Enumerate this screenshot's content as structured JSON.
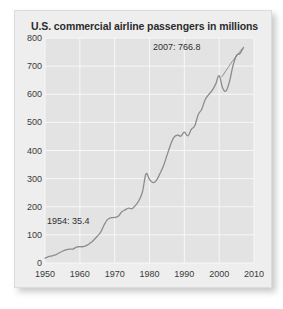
{
  "figure": {
    "title": "U.S. commercial airline passengers in millions",
    "card_bg": "#eeeeee",
    "plot_bg": "#e3e3e3",
    "line_color": "#8c8c8c",
    "grid_color": "#f7f7f7",
    "text_color": "#2b2b2b"
  },
  "chart_data": {
    "type": "line",
    "title": "U.S. commercial airline passengers in millions",
    "xlabel": "",
    "ylabel": "",
    "xlim": [
      1950,
      2010
    ],
    "ylim": [
      0,
      800
    ],
    "grid": true,
    "legend": null,
    "ytick_labels": [
      "800",
      "700",
      "600",
      "500",
      "400",
      "300",
      "200",
      "100",
      "0"
    ],
    "yticks": [
      800,
      700,
      600,
      500,
      400,
      300,
      200,
      100,
      0
    ],
    "xtick_labels": [
      "1950",
      "1960",
      "1970",
      "1980",
      "1990",
      "2000",
      "2010"
    ],
    "xticks": [
      1950,
      1960,
      1970,
      1980,
      1990,
      2000,
      2010
    ],
    "annotations": [
      {
        "name": "start-point-label",
        "text": "1954: 35.4",
        "x": 1954,
        "y": 35.4
      },
      {
        "name": "peak-point-label",
        "text": "2007: 766.8",
        "x": 2007,
        "y": 766.8
      }
    ],
    "x": [
      1950,
      1951,
      1952,
      1953,
      1954,
      1955,
      1956,
      1957,
      1958,
      1959,
      1960,
      1961,
      1962,
      1963,
      1964,
      1965,
      1966,
      1967,
      1968,
      1969,
      1970,
      1971,
      1972,
      1973,
      1974,
      1975,
      1976,
      1977,
      1978,
      1979,
      1980,
      1981,
      1982,
      1983,
      1984,
      1985,
      1986,
      1987,
      1988,
      1989,
      1990,
      1991,
      1992,
      1993,
      1994,
      1995,
      1996,
      1997,
      1998,
      1999,
      2000,
      2001,
      2002,
      2003,
      2004,
      2005,
      2006,
      2007
    ],
    "y": [
      17.3,
      22.7,
      25.5,
      28.7,
      35.4,
      41.7,
      46.7,
      49.5,
      49.4,
      56.4,
      57.9,
      58.0,
      62.4,
      70.9,
      81.9,
      95.2,
      110.0,
      136.0,
      155.0,
      161.0,
      162.0,
      166.0,
      181.0,
      189.0,
      195.0,
      193.0,
      205.0,
      223.0,
      254.0,
      317.0,
      297.0,
      286.0,
      294.0,
      318.0,
      345.0,
      382.0,
      419.0,
      447.0,
      455.0,
      451.0,
      465.0,
      452.0,
      475.0,
      488.0,
      528.0,
      547.0,
      581.0,
      599.0,
      614.0,
      636.0,
      666.0,
      622.0,
      612.0,
      647.0,
      703.0,
      738.0,
      745.0,
      766.8
    ],
    "series": [
      {
        "name": "U.S. commercial airline passengers",
        "units": "millions",
        "values": [
          17.3,
          22.7,
          25.5,
          28.7,
          35.4,
          41.7,
          46.7,
          49.5,
          49.4,
          56.4,
          57.9,
          58.0,
          62.4,
          70.9,
          81.9,
          95.2,
          110.0,
          136.0,
          155.0,
          161.0,
          162.0,
          166.0,
          181.0,
          189.0,
          195.0,
          193.0,
          205.0,
          223.0,
          254.0,
          317.0,
          297.0,
          286.0,
          294.0,
          318.0,
          345.0,
          382.0,
          419.0,
          447.0,
          455.0,
          451.0,
          465.0,
          452.0,
          475.0,
          488.0,
          528.0,
          547.0,
          581.0,
          599.0,
          614.0,
          636.0,
          666.0,
          622.0,
          612.0,
          647.0,
          703.0,
          738.0,
          745.0,
          766.8
        ]
      }
    ]
  }
}
